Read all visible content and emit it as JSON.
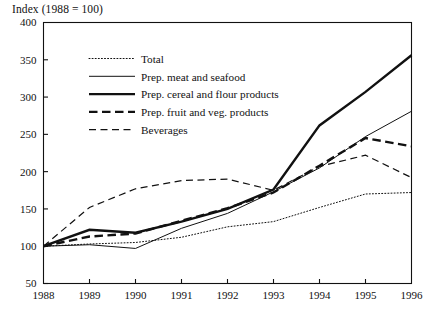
{
  "chart_data": {
    "type": "line",
    "title": "Index (1988 = 100)",
    "xlabel": "",
    "ylabel": "",
    "ylim": [
      50,
      400
    ],
    "ytick_step": 50,
    "yticks": [
      50,
      100,
      150,
      200,
      250,
      300,
      350,
      400
    ],
    "x": [
      1988,
      1989,
      1990,
      1991,
      1992,
      1993,
      1994,
      1995,
      1996
    ],
    "xticks": [
      "1988",
      "1989",
      "1990",
      "1991",
      "1992",
      "1993",
      "1994",
      "1995",
      "1996"
    ],
    "grid": false,
    "legend_position": "upper-left-inside",
    "series": [
      {
        "name": "Total",
        "style": "dotted",
        "width": 1.0,
        "values": [
          100,
          103,
          105,
          112,
          126,
          133,
          152,
          170,
          172
        ]
      },
      {
        "name": "Prep. meat and seafood",
        "style": "solid",
        "width": 1.0,
        "values": [
          100,
          102,
          97,
          124,
          144,
          173,
          205,
          247,
          281
        ]
      },
      {
        "name": "Prep. cereal and flour products",
        "style": "solid",
        "width": 2.4,
        "values": [
          100,
          122,
          118,
          133,
          150,
          176,
          262,
          307,
          356
        ]
      },
      {
        "name": "Prep. fruit and veg. products",
        "style": "dashed",
        "width": 2.4,
        "values": [
          100,
          113,
          117,
          134,
          151,
          172,
          208,
          245,
          234
        ]
      },
      {
        "name": "Beverages",
        "style": "dashed",
        "width": 1.2,
        "values": [
          100,
          152,
          177,
          188,
          190,
          175,
          207,
          222,
          192
        ]
      }
    ]
  },
  "legend": {
    "items": [
      {
        "label": "Total"
      },
      {
        "label": "Prep. meat and seafood"
      },
      {
        "label": "Prep. cereal and flour products"
      },
      {
        "label": "Prep. fruit and veg. products"
      },
      {
        "label": "Beverages"
      }
    ]
  },
  "colors": {
    "ink": "#111111",
    "background": "#ffffff"
  }
}
